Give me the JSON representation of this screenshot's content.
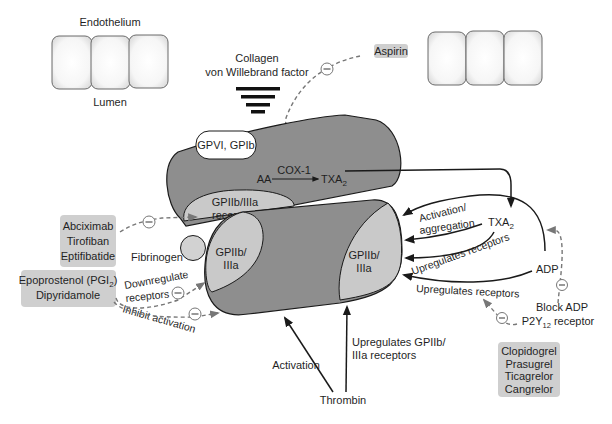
{
  "colors": {
    "platelet_fill": "#8e8e8e",
    "receptor_fill": "#c9c9c9",
    "drug_box_fill": "#cfcfcf",
    "inhibition_dash": "#777777",
    "arrow": "#1a1a1a"
  },
  "vessel": {
    "endothelium_label": "Endothelium",
    "lumen_label": "Lumen"
  },
  "subendothelium": {
    "collagen_label": "Collagen",
    "vwf_label": "von Willebrand factor"
  },
  "upper_platelet": {
    "gp_receptor_label": "GPVI, GPIb",
    "aa_label": "AA",
    "cox_label": "COX-1",
    "txa_label": "TXA",
    "txa_sub": "2",
    "gp2b3a_line1": "GPIIb/IIIa",
    "gp2b3a_line2": "receptors"
  },
  "lower_platelet": {
    "left_receptor_line1": "GPIIb/",
    "left_receptor_line2": "IIIa",
    "right_receptor_line1": "GPIIb/",
    "right_receptor_line2": "IIIa"
  },
  "fibrinogen_label": "Fibrinogen",
  "mediators": {
    "txa_label": "TXA",
    "txa_sub": "2",
    "adp_label": "ADP",
    "activation_line1": "Activation/",
    "activation_line2": "aggregation",
    "upregulates_txa": "Upregulates receptors",
    "upregulates_adp": "Upregulates receptors",
    "block_adp_line1": "Block ADP",
    "block_adp_line2_pre": "P2Y",
    "block_adp_line2_sub": "12",
    "block_adp_line2_post": " receptor"
  },
  "thrombin": {
    "label": "Thrombin",
    "activation_label": "Activation",
    "upregulates_line1": "Upregulates GPIIb/",
    "upregulates_line2": "IIIa receptors"
  },
  "prostacyclin_effects": {
    "downregulate_line1": "Downregulate",
    "downregulate_line2": "receptors",
    "inhibit_label": "Inhibit activation"
  },
  "drugs": {
    "aspirin": [
      "Aspirin"
    ],
    "gp2b3a_inhibitors": [
      "Abciximab",
      "Tirofiban",
      "Eptifibatide"
    ],
    "pgi_drugs": {
      "line1_pre": "Epoprostenol (PGI",
      "line1_sub": "2",
      "line1_post": ")",
      "line2": "Dipyridamole"
    },
    "p2y12_inhibitors": [
      "Clopidogrel",
      "Prasugrel",
      "Ticagrelor",
      "Cangrelor"
    ]
  },
  "inhibition_symbol": "−"
}
